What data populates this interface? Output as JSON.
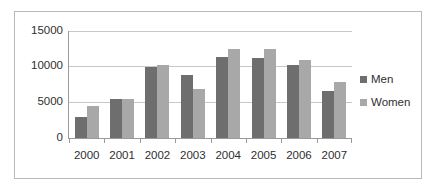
{
  "chart_data": {
    "type": "bar",
    "title": "",
    "subtitle": "",
    "xlabel": "",
    "ylabel": "",
    "categories": [
      "2000",
      "2001",
      "2002",
      "2003",
      "2004",
      "2005",
      "2006",
      "2007"
    ],
    "series": [
      {
        "name": "Men",
        "color": "#6e6e6e",
        "values": [
          3000,
          5500,
          9900,
          8800,
          11300,
          11200,
          10300,
          6600
        ]
      },
      {
        "name": "Women",
        "color": "#a8a8a8",
        "values": [
          4500,
          5400,
          10300,
          6900,
          12500,
          12500,
          11000,
          7900
        ]
      }
    ],
    "ylim": [
      0,
      15000
    ],
    "yticks": [
      0,
      5000,
      10000,
      15000
    ],
    "ytick_labels": [
      "0",
      "5000",
      "10000",
      "15000"
    ],
    "grid": true,
    "legend_position": "right",
    "legend": [
      "Men",
      "Women"
    ]
  },
  "colors": {
    "men": "#6e6e6e",
    "women": "#a8a8a8",
    "gridline": "#c8c8c8",
    "axis": "#9a9a9a",
    "frame": "#b9b9b9",
    "text": "#2f2f2f",
    "background": "#ffffff"
  }
}
